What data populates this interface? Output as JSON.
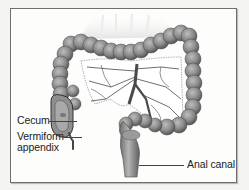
{
  "figure": {
    "labels": [
      {
        "id": "cecum",
        "text": "Cecum"
      },
      {
        "id": "appendix",
        "text": "Vermiform appendix",
        "lines": [
          "Vermiform",
          "appendix"
        ]
      },
      {
        "id": "anal-canal",
        "text": "Anal canal"
      }
    ],
    "colors": {
      "frame_border": "#6e6e6e",
      "background": "#fdfdfc",
      "tissue": "#8f8f8f",
      "tissue_dark": "#5a5a5a",
      "mesentery": "#ffffff",
      "vessel": "#3a3a3a"
    }
  }
}
